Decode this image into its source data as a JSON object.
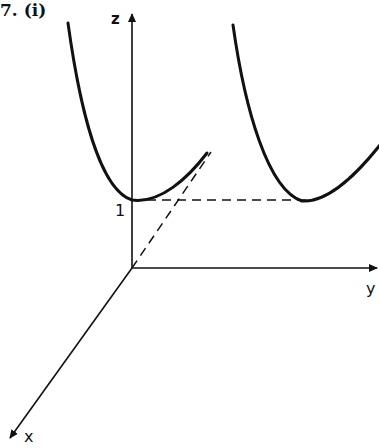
{
  "figure": {
    "number_label": "7.",
    "part_label": "(i)"
  },
  "axes": {
    "z_label": "z",
    "y_label": "y",
    "x_label": "x",
    "tick_label": "1"
  },
  "colors": {
    "ink": "#111111",
    "background": "#ffffff"
  },
  "geometry": {
    "origin": [
      132,
      268
    ],
    "z_axis_top": [
      132,
      12
    ],
    "y_axis_end": [
      379,
      268
    ],
    "x_axis_end": [
      8,
      440
    ],
    "level_z1_y": 200,
    "left_parabola": {
      "start": [
        68,
        23
      ],
      "vertex": [
        132,
        200
      ],
      "end": [
        207,
        153
      ]
    },
    "right_parabola": {
      "start": [
        233,
        25
      ],
      "vertex": [
        302,
        200
      ],
      "end": [
        379,
        145
      ]
    },
    "dashed_horizontal": [
      [
        132,
        200
      ],
      [
        316,
        200
      ]
    ],
    "dashed_diagonal": [
      [
        132,
        268
      ],
      [
        211,
        152
      ]
    ]
  }
}
